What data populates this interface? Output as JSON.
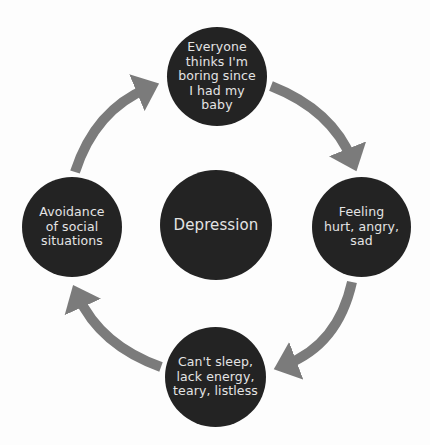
{
  "diagram": {
    "type": "cycle",
    "center": {
      "label": "Depression"
    },
    "nodes": {
      "top": {
        "label": "Everyone\nthinks I'm\nboring since\nI had my\nbaby"
      },
      "right": {
        "label": "Feeling\nhurt, angry,\nsad"
      },
      "bottom": {
        "label": "Can't sleep,\nlack energy,\nteary, listless"
      },
      "left": {
        "label": "Avoidance\nof social\nsituations"
      }
    },
    "flow": [
      "top",
      "right",
      "bottom",
      "left",
      "top"
    ],
    "colors": {
      "node_fill": "#232323",
      "node_text": "#e4e4e4",
      "arrow": "#7b7b7b",
      "background": "#fdfdfd"
    }
  }
}
